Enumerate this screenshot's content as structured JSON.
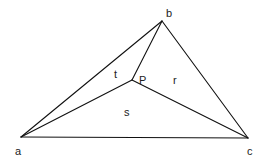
{
  "diagram": {
    "type": "triangle-with-interior-point",
    "vertices": {
      "a": {
        "label": "a",
        "x": 21,
        "y": 137,
        "lx": 15,
        "ly": 155
      },
      "b": {
        "label": "b",
        "x": 162,
        "y": 21,
        "lx": 166,
        "ly": 17
      },
      "c": {
        "label": "c",
        "x": 248,
        "y": 138,
        "lx": 247,
        "ly": 155
      }
    },
    "interior_point": {
      "label": "P",
      "x": 132,
      "y": 80,
      "lx": 139,
      "ly": 84
    },
    "regions": [
      {
        "label": "t",
        "lx": 114,
        "ly": 78
      },
      {
        "label": "r",
        "lx": 173,
        "ly": 84
      },
      {
        "label": "s",
        "lx": 124,
        "ly": 116
      }
    ],
    "stroke_color": "#111111",
    "background": "#ffffff"
  }
}
